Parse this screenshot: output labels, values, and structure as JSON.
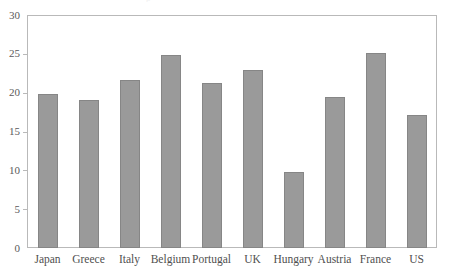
{
  "chart_data": {
    "type": "bar",
    "title": "",
    "xlabel": "",
    "ylabel": "",
    "categories": [
      "Japan",
      "Greece",
      "Italy",
      "Belgium",
      "Portugal",
      "UK",
      "Hungary",
      "Austria",
      "France",
      "US"
    ],
    "values": [
      19.8,
      19.0,
      21.6,
      24.9,
      21.2,
      22.9,
      9.8,
      19.5,
      25.1,
      17.1
    ],
    "ylim": [
      0,
      30
    ],
    "ytick_labels": [
      "0",
      "5",
      "10",
      "15",
      "20",
      "25",
      "30"
    ],
    "ytick_values": [
      0,
      5,
      10,
      15,
      20,
      25,
      30
    ],
    "grid": false,
    "legend": null,
    "bar_color": "#9a9a9a",
    "bar_border_color": "#868686",
    "frame_color": "#b9b9b9",
    "text_color": "#4f4f4f"
  },
  "title_remnant": "p"
}
